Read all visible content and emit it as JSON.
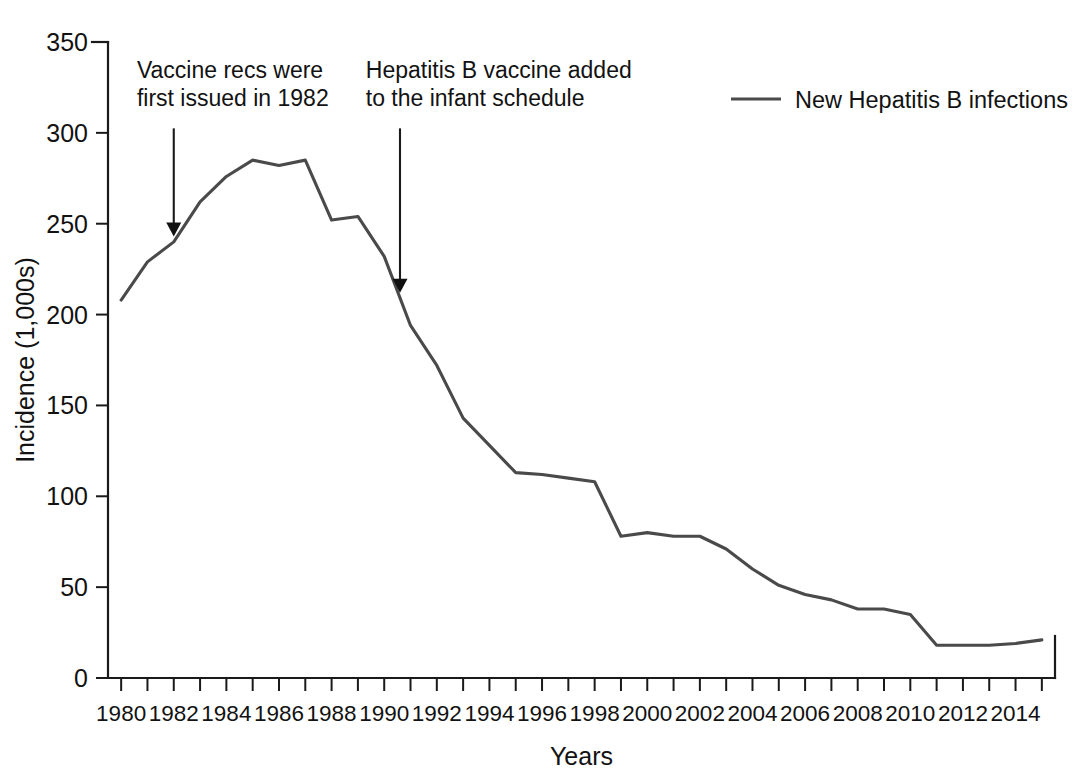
{
  "chart_data": {
    "type": "line",
    "title": "",
    "xlabel": "Years",
    "ylabel": "Incidence (1,000s)",
    "xlim": [
      1979.5,
      2015.5
    ],
    "ylim": [
      0,
      350
    ],
    "grid": false,
    "legend_position": "top-right",
    "x_tick_labels": [
      "1980",
      "1982",
      "1984",
      "1986",
      "1988",
      "1990",
      "1992",
      "1994",
      "1996",
      "1998",
      "2000",
      "2002",
      "2004",
      "2006",
      "2008",
      "2010",
      "2012",
      "2014"
    ],
    "y_tick_labels": [
      "0",
      "50",
      "100",
      "150",
      "200",
      "250",
      "300",
      "350"
    ],
    "y_ticks": [
      0,
      50,
      100,
      150,
      200,
      250,
      300,
      350
    ],
    "x": [
      1980,
      1981,
      1982,
      1983,
      1984,
      1985,
      1986,
      1987,
      1988,
      1989,
      1990,
      1991,
      1992,
      1993,
      1994,
      1995,
      1996,
      1997,
      1998,
      1999,
      2000,
      2001,
      2002,
      2003,
      2004,
      2005,
      2006,
      2007,
      2008,
      2009,
      2010,
      2011,
      2012,
      2013,
      2014,
      2015
    ],
    "series": [
      {
        "name": "New Hepatitis B infections",
        "color": "#4a4a4a",
        "values": [
          208,
          229,
          240,
          262,
          276,
          285,
          282,
          285,
          252,
          254,
          232,
          194,
          172,
          143,
          128,
          113,
          112,
          110,
          108,
          78,
          80,
          78,
          78,
          71,
          60,
          51,
          46,
          43,
          38,
          38,
          35,
          18,
          18,
          18,
          19,
          21
        ]
      }
    ],
    "annotations": [
      {
        "id": "vaccine-recs",
        "lines": [
          "Vaccine recs were",
          "first issued in 1982"
        ],
        "target_x": 1982,
        "target_y": 243,
        "text_x": 1980.6,
        "text_top_y": 330
      },
      {
        "id": "infant-schedule",
        "lines": [
          "Hepatitis B vaccine added",
          "to the infant schedule"
        ],
        "target_x": 1990.6,
        "target_y": 212,
        "text_x": 1989.3,
        "text_top_y": 330
      }
    ],
    "legend": [
      {
        "label": "New Hepatitis B infections",
        "color": "#4a4a4a"
      }
    ]
  }
}
